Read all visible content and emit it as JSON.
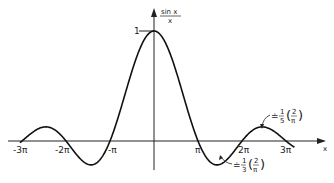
{
  "chart_data": {
    "type": "line",
    "title": "",
    "function": "sin x / x",
    "xlabel": "x",
    "ylabel": "sin x / x",
    "ylabel_parts": {
      "numerator": "sin x",
      "denominator": "x"
    },
    "x_ticks": [
      "-3π",
      "-2π",
      "-π",
      "π",
      "2π",
      "3π"
    ],
    "x_tick_values": [
      -9.4248,
      -6.2832,
      -3.1416,
      3.1416,
      6.2832,
      9.4248
    ],
    "y_ticks": [
      "1"
    ],
    "xlim": [
      -9.6,
      10.2
    ],
    "ylim": [
      -0.3,
      1.25
    ],
    "grid": false,
    "legend": null,
    "series": [
      {
        "name": "sin x / x",
        "x": [
          -9.4248,
          -8.5,
          -7.725,
          -7.0,
          -6.2832,
          -5.5,
          -4.493,
          -3.8,
          -3.1416,
          -2.5,
          -2.0,
          -1.5,
          -1.0,
          -0.5,
          0,
          0.5,
          1.0,
          1.5,
          2.0,
          2.5,
          3.1416,
          3.8,
          4.493,
          5.5,
          6.2832,
          7.0,
          7.725,
          8.5,
          9.4248
        ],
        "y": [
          0,
          0.094,
          0.128,
          0.094,
          0,
          -0.128,
          -0.217,
          -0.161,
          0,
          0.239,
          0.455,
          0.665,
          0.841,
          0.959,
          1,
          0.959,
          0.841,
          0.665,
          0.455,
          0.239,
          0,
          -0.161,
          -0.217,
          -0.128,
          0,
          0.094,
          0.128,
          0.094,
          0
        ]
      }
    ],
    "annotations": [
      {
        "text": "≐ 1/3 (2/π)",
        "target": "first negative minimum near x = 3π/2",
        "value": -0.2122
      },
      {
        "text": "≐ 1/5 (2/π)",
        "target": "second positive maximum near x = 5π/2",
        "value": 0.1273
      }
    ]
  },
  "labels": {
    "y_num": "sin x",
    "y_den": "x",
    "y_one": "1",
    "x_axis": "x",
    "ticks": [
      "-3π",
      "-2π",
      "-π",
      "π",
      "2π",
      "3π"
    ],
    "ann1_prefix": "≐",
    "ann1_frac_n": "1",
    "ann1_frac_d": "3",
    "ann1_inner_n": "2",
    "ann1_inner_d": "π",
    "ann2_prefix": "≐",
    "ann2_frac_n": "1",
    "ann2_frac_d": "5",
    "ann2_inner_n": "2",
    "ann2_inner_d": "π"
  }
}
